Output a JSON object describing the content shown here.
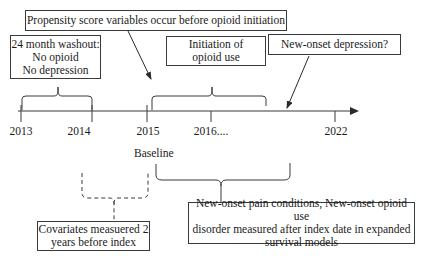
{
  "diagram": {
    "type": "timeline-study-design",
    "boxes": {
      "propensity": "Propensity score variables occur before opioid initiation",
      "washout": [
        "24 month washout:",
        "No opioid",
        "No depression"
      ],
      "initiation": [
        "Initiation of",
        "opioid use"
      ],
      "depression": "New-onset depression?",
      "covariates": [
        "Covariates measuered 2",
        "years before index"
      ],
      "outcomes": [
        "New-onset pain conditions, New-onset opioid use",
        "disorder measured after index date in expanded",
        "survival models"
      ]
    },
    "timeline": {
      "ticks": [
        {
          "label": "2013",
          "x": 21
        },
        {
          "label": "2014",
          "x": 92
        },
        {
          "label": "2015",
          "x": 147
        },
        {
          "label": "2016....",
          "x": 211
        },
        {
          "label": "2022",
          "x": 335
        }
      ],
      "baseline_label": "Baseline"
    },
    "colors": {
      "line": "#3a3a3a",
      "text": "#1a1a1a",
      "background": "#ffffff"
    }
  }
}
